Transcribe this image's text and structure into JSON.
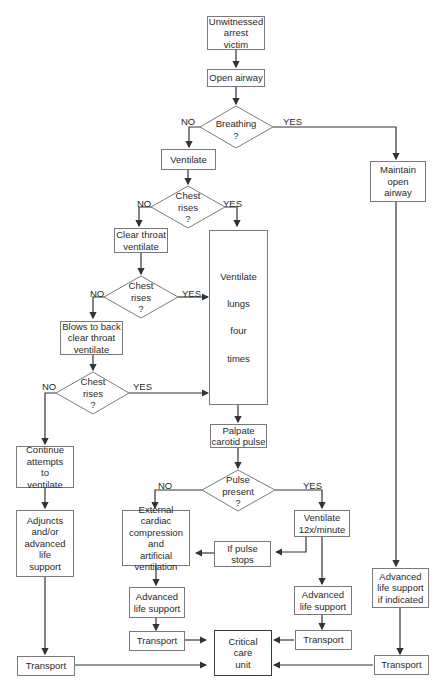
{
  "diagram": {
    "nodes": {
      "start": "Unwitnessed\narrest\nvictim",
      "open_airway": "Open airway",
      "breathing": "Breathing\n?",
      "ventilate": "Ventilate",
      "maintain_airway": "Maintain\nopen\nairway",
      "chest_rises_1": "Chest\nrises\n?",
      "clear_throat": "Clear throat\nventilate",
      "chest_rises_2": "Chest\nrises\n?",
      "blows_to_back": "Blows to back\nclear throat\nventilate",
      "chest_rises_3": "Chest\nrises\n?",
      "ventilate_lungs": [
        "Ventilate",
        "lungs",
        "four",
        "times"
      ],
      "palpate": "Palpate\ncarotid pulse",
      "pulse_present": "Pulse\npresent\n?",
      "continue_attempts": "Continue\nattempts\nto\nventilate",
      "adjuncts": "Adjuncts\nand/or\nadvanced\nlife\nsupport",
      "external_cardiac": "External cardiac\ncompression\nand\nartificial\nventilation",
      "ventilate_12": "Ventilate\n12x/minute",
      "if_pulse_stops": "If pulse\nstops",
      "als_left": "Advanced\nlife support",
      "als_right": "Advanced\nlife support",
      "als_if_indicated": "Advanced\nlife support\nif indicated",
      "transport_far_left": "Transport",
      "transport_left": "Transport",
      "transport_right": "Transport",
      "transport_far_right": "Transport",
      "critical_care": "Critical\ncare\nunit"
    },
    "edge_labels": {
      "no": "NO",
      "yes": "YES"
    },
    "colors": {
      "line": "#333333",
      "box_border": "#7a7a7a"
    }
  }
}
